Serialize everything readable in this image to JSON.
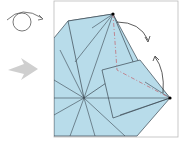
{
  "diagram": {
    "type": "origami-step",
    "symbols": {
      "turn_over": "turn-over-icon",
      "step_arrow": "step-arrow-icon",
      "fold_arrows": [
        "fold-arrow-top",
        "fold-arrow-right"
      ]
    },
    "colors": {
      "paper": "#b8dcea",
      "crease": "#3a4650",
      "mountain_fold": "#c0707a",
      "arrow_gray": "#cccccc",
      "frame": "#999999"
    }
  }
}
